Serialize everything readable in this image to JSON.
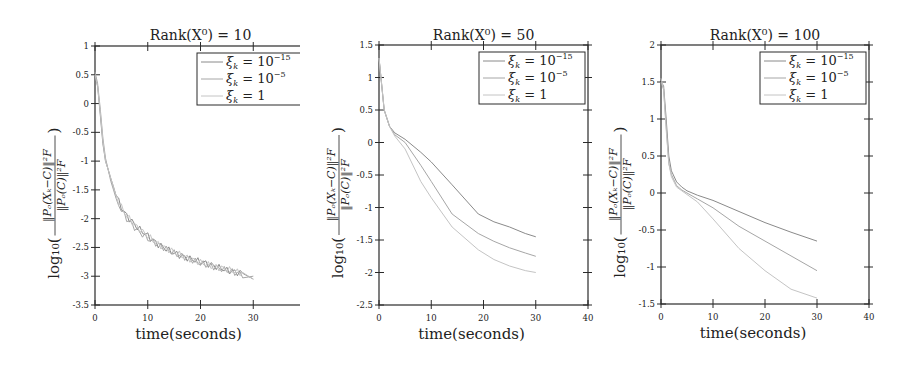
{
  "figure": {
    "panels": [
      {
        "title": "Rank(X⁰) = 10"
      },
      {
        "title": "Rank(X⁰) = 50"
      },
      {
        "title": "Rank(X⁰) = 100"
      }
    ]
  },
  "chart_data": [
    {
      "type": "line",
      "title": "Rank(X^0) = 10",
      "xlabel": "time(seconds)",
      "ylabel": "log10( ||P_O(X_k - C)||_F^2 / ||P_O(C)||_F^2 )",
      "xlim": [
        0,
        40
      ],
      "ylim": [
        -3.5,
        1
      ],
      "xticks": [
        0,
        10,
        20,
        30,
        40
      ],
      "yticks": [
        1,
        0.5,
        0,
        -0.5,
        -1,
        -1.5,
        -2,
        -2.5,
        -3,
        -3.5
      ],
      "grid": false,
      "legend_position": "upper right",
      "series": [
        {
          "name": "ξ_k = 10^-15",
          "x": [
            0,
            0.5,
            1,
            1.5,
            2,
            3,
            4,
            5,
            6,
            8,
            10,
            12,
            15,
            18,
            20,
            22,
            25,
            28,
            30
          ],
          "y": [
            0.5,
            0.3,
            -0.2,
            -0.7,
            -1.0,
            -1.3,
            -1.6,
            -1.8,
            -1.95,
            -2.15,
            -2.3,
            -2.45,
            -2.6,
            -2.7,
            -2.75,
            -2.8,
            -2.9,
            -2.95,
            -3.05
          ]
        },
        {
          "name": "ξ_k = 10^-5",
          "x": [
            0,
            0.5,
            1,
            1.5,
            2,
            3,
            4,
            5,
            6,
            8,
            10,
            12,
            15,
            18,
            20,
            22,
            25,
            28,
            30
          ],
          "y": [
            0.55,
            0.35,
            -0.1,
            -0.6,
            -0.95,
            -1.35,
            -1.65,
            -1.85,
            -2.0,
            -2.2,
            -2.35,
            -2.45,
            -2.6,
            -2.7,
            -2.78,
            -2.82,
            -2.9,
            -2.97,
            -3.0
          ]
        },
        {
          "name": "ξ_k = 1",
          "x": [
            0,
            0.5,
            1,
            1.5,
            2,
            3,
            4,
            5,
            6,
            8,
            10,
            12,
            15,
            18,
            20,
            22,
            25,
            28,
            30
          ],
          "y": [
            0.5,
            0.3,
            -0.15,
            -0.65,
            -1.0,
            -1.3,
            -1.6,
            -1.8,
            -1.95,
            -2.15,
            -2.3,
            -2.45,
            -2.58,
            -2.7,
            -2.76,
            -2.82,
            -2.88,
            -2.95,
            -3.05
          ]
        }
      ]
    },
    {
      "type": "line",
      "title": "Rank(X^0) = 50",
      "xlabel": "time(seconds)",
      "ylabel": "log10( ||P_O(X_k - C)||_F^2 / ||P_O(C)||_F^2 )",
      "xlim": [
        0,
        40
      ],
      "ylim": [
        -2.5,
        1.5
      ],
      "xticks": [
        0,
        10,
        20,
        30,
        40
      ],
      "yticks": [
        1.5,
        1,
        0.5,
        0,
        -0.5,
        -1,
        -1.5,
        -2,
        -2.5
      ],
      "grid": false,
      "legend_position": "upper right",
      "series": [
        {
          "name": "ξ_k = 10^-15",
          "x": [
            0,
            0.5,
            1,
            2,
            3,
            5,
            8,
            10,
            14,
            19,
            22,
            25,
            28,
            30
          ],
          "y": [
            1.3,
            0.9,
            0.5,
            0.25,
            0.15,
            0.05,
            -0.15,
            -0.3,
            -0.65,
            -1.1,
            -1.22,
            -1.3,
            -1.4,
            -1.45
          ]
        },
        {
          "name": "ξ_k = 10^-5",
          "x": [
            0,
            0.5,
            1,
            2,
            3,
            5,
            8,
            10,
            14,
            19,
            22,
            25,
            28,
            30
          ],
          "y": [
            1.3,
            0.9,
            0.5,
            0.25,
            0.12,
            0.0,
            -0.35,
            -0.6,
            -1.1,
            -1.4,
            -1.52,
            -1.62,
            -1.7,
            -1.75
          ]
        },
        {
          "name": "ξ_k = 1",
          "x": [
            0,
            0.5,
            1,
            2,
            3,
            5,
            8,
            10,
            14,
            19,
            22,
            25,
            28,
            30
          ],
          "y": [
            1.3,
            0.9,
            0.5,
            0.25,
            0.1,
            -0.1,
            -0.6,
            -0.85,
            -1.3,
            -1.65,
            -1.8,
            -1.9,
            -1.97,
            -2.0
          ]
        }
      ]
    },
    {
      "type": "line",
      "title": "Rank(X^0) = 100",
      "xlabel": "time(seconds)",
      "ylabel": "log10( ||P_O(X_k - C)||_F^2 / ||P_O(C)||_F^2 )",
      "xlim": [
        0,
        40
      ],
      "ylim": [
        -1.5,
        2
      ],
      "xticks": [
        0,
        10,
        20,
        30,
        40
      ],
      "yticks": [
        2,
        1.5,
        1,
        0.5,
        0,
        -0.5,
        -1,
        -1.5
      ],
      "grid": false,
      "legend_position": "upper right",
      "series": [
        {
          "name": "ξ_k = 10^-15",
          "x": [
            0,
            0.5,
            1,
            1.5,
            2,
            3,
            4,
            5,
            7,
            10,
            15,
            20,
            25,
            30
          ],
          "y": [
            1.5,
            1.45,
            1.0,
            0.5,
            0.3,
            0.15,
            0.08,
            0.03,
            -0.03,
            -0.1,
            -0.25,
            -0.4,
            -0.53,
            -0.65
          ]
        },
        {
          "name": "ξ_k = 10^-5",
          "x": [
            0,
            0.5,
            1,
            1.5,
            2,
            3,
            4,
            5,
            7,
            10,
            15,
            20,
            25,
            30
          ],
          "y": [
            1.5,
            1.4,
            0.9,
            0.4,
            0.25,
            0.1,
            0.04,
            0.0,
            -0.08,
            -0.2,
            -0.45,
            -0.65,
            -0.85,
            -1.05
          ]
        },
        {
          "name": "ξ_k = 1",
          "x": [
            0,
            0.5,
            1,
            1.5,
            2,
            3,
            4,
            5,
            7,
            10,
            15,
            20,
            25,
            30
          ],
          "y": [
            1.55,
            1.4,
            0.85,
            0.4,
            0.22,
            0.08,
            0.03,
            -0.02,
            -0.12,
            -0.35,
            -0.75,
            -1.05,
            -1.3,
            -1.42
          ]
        }
      ]
    }
  ],
  "colors": {
    "axis": "#2a2a2a",
    "series": [
      "#8a8a8a",
      "#a6a6a6",
      "#c4c4c4"
    ]
  }
}
